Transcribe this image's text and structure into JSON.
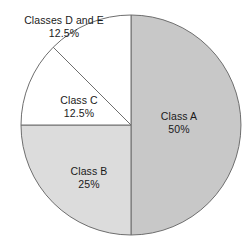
{
  "chart_data": {
    "type": "pie",
    "title": "",
    "subtitle": "",
    "xlabel": "",
    "ylabel": "",
    "legend": "none",
    "grid": false,
    "labels_inside": true,
    "start_angle_deg": 90,
    "direction": "clockwise",
    "categories": [
      "Class A",
      "Class B",
      "Class C",
      "Classes D and E"
    ],
    "values": [
      50,
      25,
      12.5,
      12.5
    ],
    "value_suffix": "%",
    "slices": [
      {
        "name": "Class A",
        "value": 50,
        "value_text": "50%",
        "color": "#c8c8c8",
        "start_deg": 0,
        "end_deg": 180,
        "label_position": "inside-right"
      },
      {
        "name": "Class B",
        "value": 25,
        "value_text": "25%",
        "color": "#dcdcdc",
        "start_deg": 180,
        "end_deg": 270,
        "label_position": "inside-lower-left"
      },
      {
        "name": "Class C",
        "value": 12.5,
        "value_text": "12.5%",
        "color": "#ffffff",
        "start_deg": 270,
        "end_deg": 315,
        "label_position": "inside-upper-left"
      },
      {
        "name": "Classes D and E",
        "value": 12.5,
        "value_text": "12.5%",
        "color": "#ffffff",
        "start_deg": 315,
        "end_deg": 360,
        "label_position": "outside-top-left"
      }
    ],
    "geometry": {
      "center_x": 131,
      "center_y": 125,
      "radius": 110
    },
    "style": {
      "background": "#ffffff",
      "stroke": "#6e6e6e",
      "stroke_width": 1,
      "text_color": "#1a1a1a"
    }
  }
}
